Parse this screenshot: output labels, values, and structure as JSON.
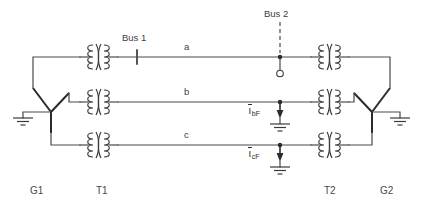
{
  "diagram": {
    "buses": [
      {
        "id": "bus1",
        "label": "Bus 1"
      },
      {
        "id": "bus2",
        "label": "Bus 2"
      }
    ],
    "phases": [
      {
        "id": "a",
        "label": "a"
      },
      {
        "id": "b",
        "label": "b"
      },
      {
        "id": "c",
        "label": "c"
      }
    ],
    "devices": [
      {
        "id": "g1",
        "label": "G1",
        "type": "generator-wye-grounded"
      },
      {
        "id": "t1",
        "label": "T1",
        "type": "transformer"
      },
      {
        "id": "t2",
        "label": "T2",
        "type": "transformer"
      },
      {
        "id": "g2",
        "label": "G2",
        "type": "generator-wye-grounded"
      }
    ],
    "fault_currents": [
      {
        "id": "ibf",
        "symbol": "I",
        "overbar": true,
        "subscript": "bF",
        "phase": "b"
      },
      {
        "id": "icf",
        "symbol": "I",
        "overbar": true,
        "subscript": "cF",
        "phase": "c"
      }
    ],
    "colors": {
      "wire": "#4a4a4a",
      "wire_dark": "#2b2b2b",
      "coil": "#3a3a3a",
      "text": "#3d3d3d",
      "background": "#ffffff"
    }
  }
}
